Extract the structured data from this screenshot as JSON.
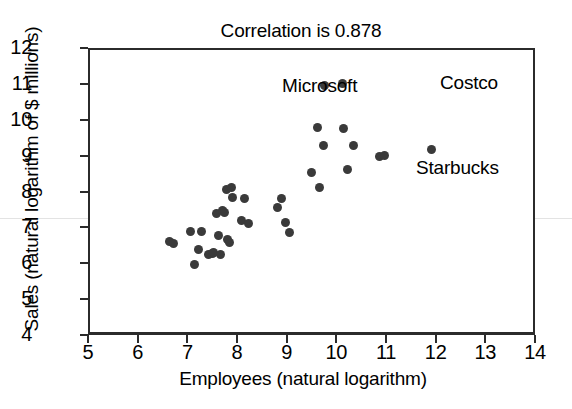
{
  "chart_data": {
    "type": "scatter",
    "title": "Correlation is 0.878",
    "xlabel": "Employees (natural logarithm)",
    "ylabel": "Sales (natural logarithm of $ millions)",
    "xlim": [
      5,
      14
    ],
    "ylim": [
      4,
      12
    ],
    "xticks": [
      "5",
      "6",
      "7",
      "8",
      "9",
      "10",
      "11",
      "12",
      "13",
      "14"
    ],
    "yticks": [
      "4",
      "5",
      "6",
      "7",
      "8",
      "9",
      "10",
      "11",
      "12"
    ],
    "grid": false,
    "legend": "none",
    "correlation": 0.878,
    "marker_color": "#3a3a3a",
    "axis_color": "#2b2b2b",
    "points": [
      {
        "x": 6.6,
        "y": 6.66
      },
      {
        "x": 6.68,
        "y": 6.62
      },
      {
        "x": 7.03,
        "y": 6.94
      },
      {
        "x": 7.1,
        "y": 6.03
      },
      {
        "x": 7.18,
        "y": 6.45
      },
      {
        "x": 7.24,
        "y": 6.95
      },
      {
        "x": 7.38,
        "y": 6.3
      },
      {
        "x": 7.46,
        "y": 6.33
      },
      {
        "x": 7.48,
        "y": 6.36
      },
      {
        "x": 7.55,
        "y": 7.43
      },
      {
        "x": 7.58,
        "y": 6.84
      },
      {
        "x": 7.62,
        "y": 6.3
      },
      {
        "x": 7.66,
        "y": 7.52
      },
      {
        "x": 7.7,
        "y": 7.48
      },
      {
        "x": 7.74,
        "y": 8.1
      },
      {
        "x": 7.76,
        "y": 6.72
      },
      {
        "x": 7.8,
        "y": 6.64
      },
      {
        "x": 7.84,
        "y": 8.18
      },
      {
        "x": 7.86,
        "y": 7.88
      },
      {
        "x": 8.05,
        "y": 7.26
      },
      {
        "x": 8.12,
        "y": 7.86
      },
      {
        "x": 8.2,
        "y": 7.16
      },
      {
        "x": 8.78,
        "y": 7.62
      },
      {
        "x": 8.86,
        "y": 7.86
      },
      {
        "x": 8.94,
        "y": 7.2
      },
      {
        "x": 9.02,
        "y": 6.9
      },
      {
        "x": 9.46,
        "y": 8.58
      },
      {
        "x": 9.58,
        "y": 9.83
      },
      {
        "x": 9.62,
        "y": 8.18
      },
      {
        "x": 9.7,
        "y": 9.33
      },
      {
        "x": 9.72,
        "y": 11.02
      },
      {
        "x": 10.08,
        "y": 11.06
      },
      {
        "x": 10.1,
        "y": 9.8
      },
      {
        "x": 10.18,
        "y": 8.66
      },
      {
        "x": 10.3,
        "y": 9.34
      },
      {
        "x": 10.82,
        "y": 9.02
      },
      {
        "x": 10.92,
        "y": 9.05
      },
      {
        "x": 11.88,
        "y": 9.22
      }
    ],
    "annotations": [
      {
        "label": "Microsoft",
        "point_x": 9.72,
        "point_y": 11.02
      },
      {
        "label": "Costco",
        "point_x": 10.08,
        "point_y": 11.06
      },
      {
        "label": "Starbucks",
        "point_x": 11.88,
        "point_y": 9.22
      }
    ]
  }
}
